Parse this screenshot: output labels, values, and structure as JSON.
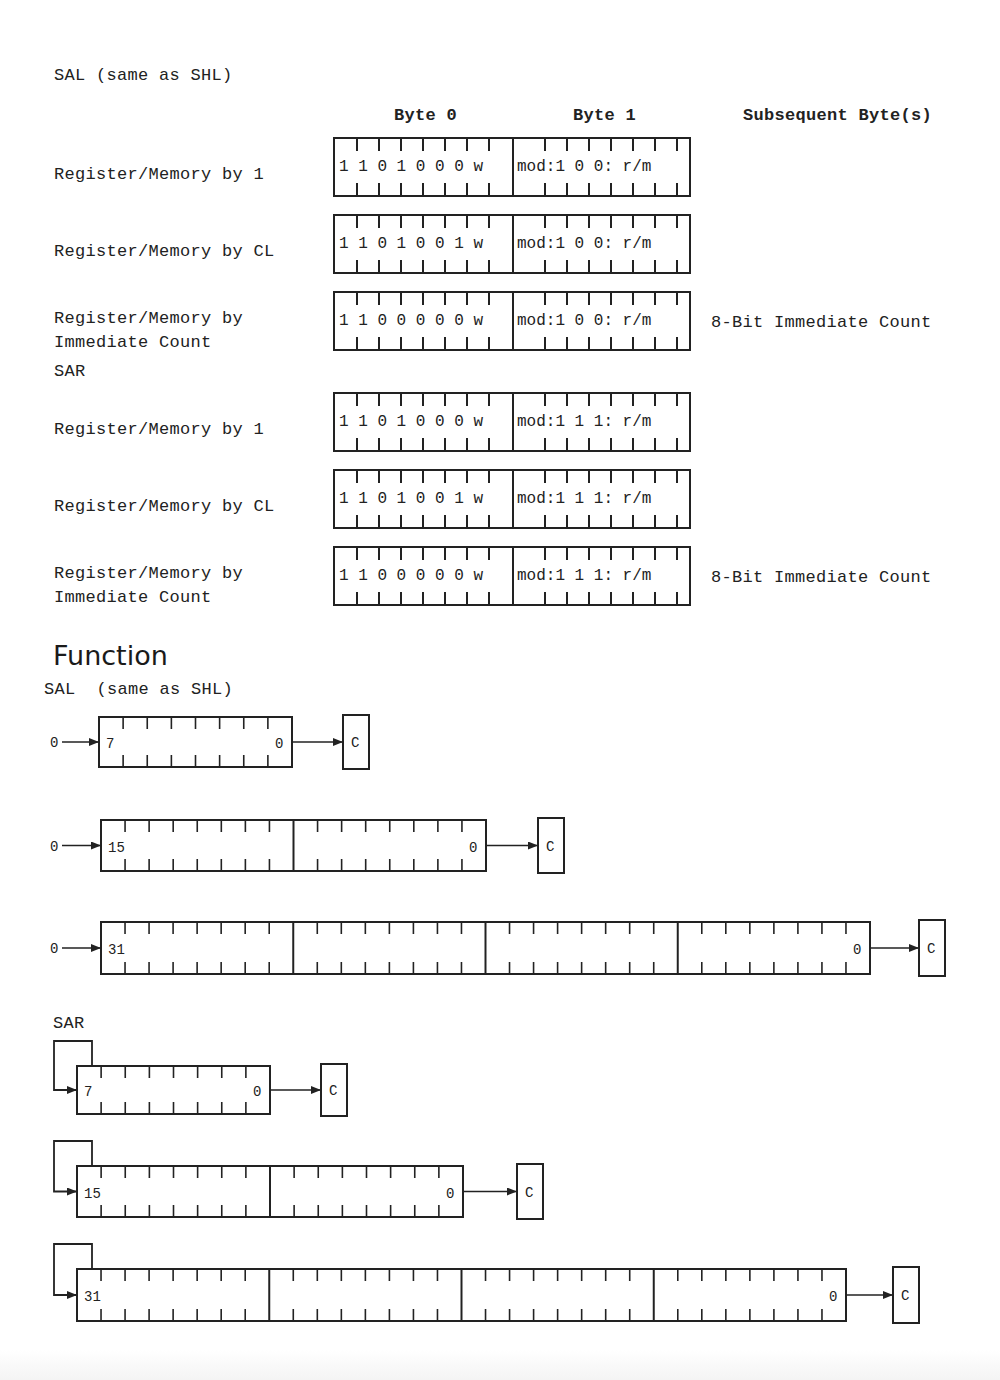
{
  "encoding_section": {
    "sal_title": "SAL (same as SHL)",
    "sar_title": "SAR",
    "column_headers": {
      "byte0": "Byte 0",
      "byte1": "Byte 1",
      "subsequent": "Subsequent Byte(s)"
    },
    "sal_rows": [
      {
        "label": "Register/Memory by 1",
        "byte0": "1 1 0 1 0 0 0 w",
        "byte1": "mod:1 0 0: r/m",
        "subsequent": ""
      },
      {
        "label": "Register/Memory by CL",
        "byte0": "1 1 0 1 0 0 1 w",
        "byte1": "mod:1 0 0: r/m",
        "subsequent": ""
      },
      {
        "label": "Register/Memory by\nImmediate Count",
        "byte0": "1 1 0 0 0 0 0 w",
        "byte1": "mod:1 0 0: r/m",
        "subsequent": "8-Bit Immediate Count"
      }
    ],
    "sar_rows": [
      {
        "label": "Register/Memory by 1",
        "byte0": "1 1 0 1 0 0 0 w",
        "byte1": "mod:1 1 1: r/m",
        "subsequent": ""
      },
      {
        "label": "Register/Memory by CL",
        "byte0": "1 1 0 1 0 0 1 w",
        "byte1": "mod:1 1 1: r/m",
        "subsequent": ""
      },
      {
        "label": "Register/Memory by\nImmediate Count",
        "byte0": "1 1 0 0 0 0 0 w",
        "byte1": "mod:1 1 1: r/m",
        "subsequent": "8-Bit Immediate Count"
      }
    ]
  },
  "function_section": {
    "heading": "Function",
    "sal_title": "SAL  (same as SHL)",
    "sar_title": "SAR",
    "sal_diagrams": [
      {
        "width_bits": 8,
        "msb_label": "7",
        "lsb_label": "0",
        "input_label": "0",
        "carry_label": "C"
      },
      {
        "width_bits": 16,
        "msb_label": "15",
        "lsb_label": "0",
        "input_label": "0",
        "carry_label": "C"
      },
      {
        "width_bits": 32,
        "msb_label": "31",
        "lsb_label": "0",
        "input_label": "0",
        "carry_label": "C"
      }
    ],
    "sar_diagrams": [
      {
        "width_bits": 8,
        "msb_label": "7",
        "lsb_label": "0",
        "carry_label": "C"
      },
      {
        "width_bits": 16,
        "msb_label": "15",
        "lsb_label": "0",
        "carry_label": "C"
      },
      {
        "width_bits": 32,
        "msb_label": "31",
        "lsb_label": "0",
        "carry_label": "C"
      }
    ]
  }
}
